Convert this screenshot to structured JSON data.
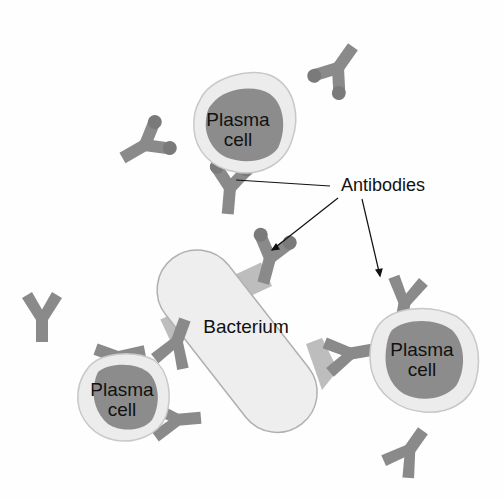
{
  "diagram": {
    "labels": {
      "plasma_cell_top": [
        "Plasma",
        "cell"
      ],
      "plasma_cell_right": [
        "Plasma",
        "cell"
      ],
      "plasma_cell_bottom_left": [
        "Plasma",
        "cell"
      ],
      "bacterium": "Bacterium",
      "antibodies": "Antibodies"
    },
    "colors": {
      "antibody": "#8a8a8a",
      "antibody_tip": "#7a7a7a",
      "cell_membrane": "#ececec",
      "cell_outline": "#c8c8c8",
      "nucleus": "#8c8c8c",
      "bacterium_fill": "#eeeeee",
      "bacterium_outline": "#b0b0b0",
      "antigen": "#bdbdbd",
      "leader_line": "#111111"
    },
    "elements": {
      "plasma_cells": 3,
      "bacteria": 1,
      "antibodies": 11,
      "leader_lines": 3
    }
  }
}
